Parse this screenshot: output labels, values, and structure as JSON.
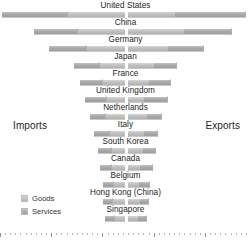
{
  "axis_titles": {
    "left": "Imports",
    "right": "Exports"
  },
  "legend": {
    "items": [
      {
        "label": "Goods",
        "key": "goods",
        "color": "#c0c0c0"
      },
      {
        "label": "Services",
        "key": "services",
        "color": "#a9a9a9"
      }
    ]
  },
  "chart_data": {
    "type": "bar",
    "subtype": "diverging-stacked-bar",
    "title": "",
    "xlabel": "",
    "ylabel": "",
    "orientation": "horizontal",
    "grid": false,
    "legend_position": "bottom-left",
    "left_axis_label": "Imports",
    "right_axis_label": "Exports",
    "categories": [
      "United States",
      "China",
      "Germany",
      "Japan",
      "France",
      "United Kingdom",
      "Netherlands",
      "Italy",
      "South Korea",
      "Canada",
      "Belgium",
      "Hong Kong (China)",
      "Singapore"
    ],
    "series": [
      {
        "name": "Imports Goods",
        "side": "left",
        "segment": "goods",
        "values": [
          58,
          48,
          39,
          26,
          23,
          19,
          20,
          16,
          14,
          14,
          12,
          13,
          11
        ]
      },
      {
        "name": "Imports Services",
        "side": "left",
        "segment": "services",
        "values": [
          66,
          43,
          37,
          25,
          22,
          21,
          15,
          15,
          13,
          11,
          10,
          9,
          9
        ]
      },
      {
        "name": "Exports Goods",
        "side": "right",
        "segment": "goods",
        "values": [
          48,
          57,
          41,
          27,
          22,
          17,
          20,
          17,
          16,
          13,
          12,
          13,
          11
        ]
      },
      {
        "name": "Exports Services",
        "side": "right",
        "segment": "services",
        "values": [
          71,
          48,
          36,
          23,
          22,
          24,
          15,
          14,
          13,
          13,
          11,
          9,
          9
        ]
      }
    ],
    "axis_ticks": {
      "major_count": 5,
      "minor_count": 44,
      "labels": []
    }
  }
}
